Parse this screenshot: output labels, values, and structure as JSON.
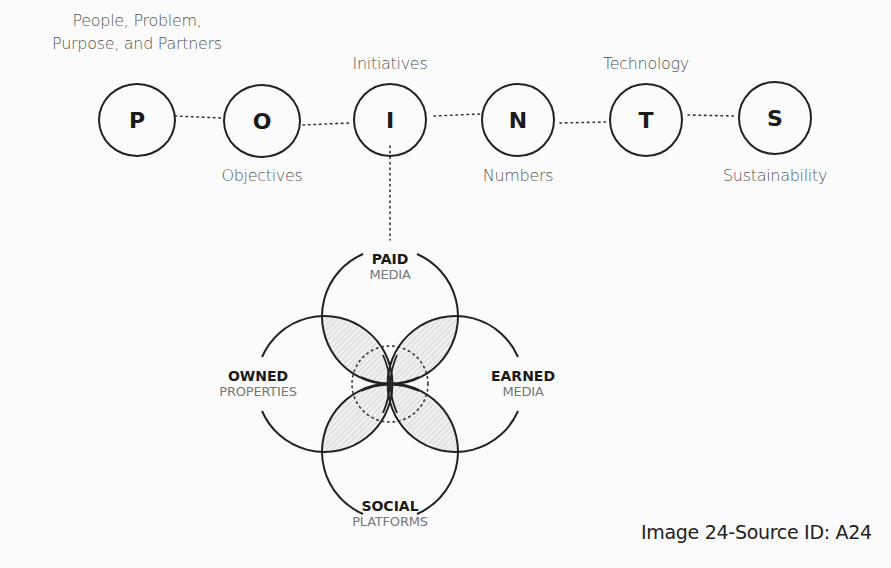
{
  "framework": {
    "acronym": "POINTS",
    "nodes": [
      {
        "letter": "P",
        "label": "People, Problem,\nPurpose, and Partners",
        "label_lines": [
          "People, Problem,",
          "Purpose, and Partners"
        ],
        "label_position": "above"
      },
      {
        "letter": "O",
        "label": "Objectives",
        "label_position": "below"
      },
      {
        "letter": "I",
        "label": "Initiatives",
        "label_position": "above"
      },
      {
        "letter": "N",
        "label": "Numbers",
        "label_position": "below"
      },
      {
        "letter": "T",
        "label": "Technology",
        "label_position": "above"
      },
      {
        "letter": "S",
        "label": "Sustainability",
        "label_position": "below"
      }
    ]
  },
  "venn": {
    "connected_to": "I",
    "sets": [
      {
        "bold": "PAID",
        "light": "MEDIA",
        "position": "top"
      },
      {
        "bold": "OWNED",
        "light": "PROPERTIES",
        "position": "left"
      },
      {
        "bold": "EARNED",
        "light": "MEDIA",
        "position": "right"
      },
      {
        "bold": "SOCIAL",
        "light": "PLATFORMS",
        "position": "bottom"
      }
    ]
  },
  "caption": "Image 24-Source ID: A24",
  "colors": {
    "stroke": "#222222",
    "label_gray": "#555555",
    "hatch": "#bbbbbb",
    "background": "#fbfbfb"
  }
}
